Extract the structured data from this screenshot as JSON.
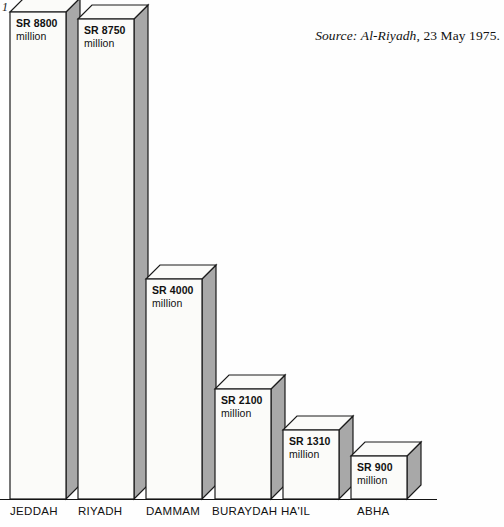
{
  "folio": "1",
  "source": {
    "label": "Source:",
    "publication": "Al-Riyadh",
    "date": ", 23 May 1975."
  },
  "chart_data": {
    "type": "bar",
    "title": "",
    "xlabel": "",
    "ylabel": "",
    "unit": "SR million",
    "categories": [
      "JEDDAH",
      "RIYADH",
      "DAMMAM",
      "BURAYDAH",
      "HA'IL",
      "ABHA"
    ],
    "values": [
      8800,
      8750,
      4000,
      2100,
      1310,
      900
    ],
    "value_labels": [
      {
        "amount": "SR 8800",
        "unit": "million"
      },
      {
        "amount": "SR 8750",
        "unit": "million"
      },
      {
        "amount": "SR 4000",
        "unit": "million"
      },
      {
        "amount": "SR 2100",
        "unit": "million"
      },
      {
        "amount": "SR 1310",
        "unit": "million"
      },
      {
        "amount": "SR 900",
        "unit": "million"
      }
    ],
    "ylim": [
      0,
      9600
    ],
    "grid": false,
    "legend": false,
    "style": "3d-isometric-bars",
    "colors": {
      "bar_face": "#fbfbf9",
      "bar_side": "#a8a8a8",
      "outline": "#1b1b1b",
      "text": "#111111",
      "background": "#fefefe"
    }
  },
  "geometry": {
    "baseline_y": 499,
    "depth_x": 14,
    "depth_y": 14,
    "bar_width": 56,
    "bars": [
      {
        "x": 10,
        "top": 12
      },
      {
        "x": 78,
        "top": 19
      },
      {
        "x": 146,
        "top": 279
      },
      {
        "x": 215,
        "top": 389
      },
      {
        "x": 283,
        "top": 430
      },
      {
        "x": 351,
        "top": 456
      }
    ],
    "city_label_x": [
      10,
      78,
      146,
      212,
      281,
      357
    ]
  }
}
